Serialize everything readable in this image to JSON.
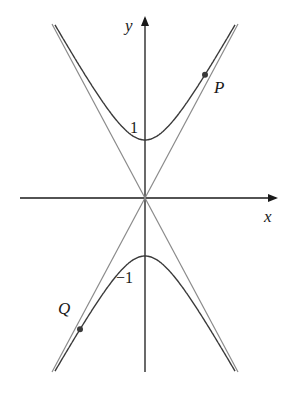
{
  "diagram": {
    "type": "hyperbola with asymptotes",
    "equation_form": "y^2 - x^2/b^2 = 1",
    "axes": {
      "x_label": "x",
      "y_label": "y"
    },
    "ticks": {
      "upper_vertex_label": "1",
      "lower_vertex_label": "−1"
    },
    "points": [
      {
        "name": "P",
        "label": "P",
        "position": "upper-right branch"
      },
      {
        "name": "Q",
        "label": "Q",
        "position": "lower-left branch"
      }
    ],
    "colors": {
      "curve": "#3a3a3a",
      "asymptote": "#8a8a8a",
      "axis": "#1a1a1a",
      "point": "#3a3a3a"
    }
  }
}
